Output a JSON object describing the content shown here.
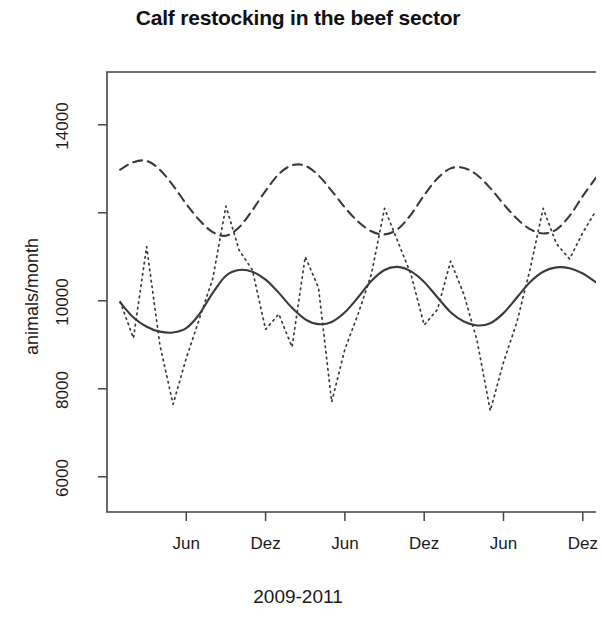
{
  "chart_data": {
    "type": "line",
    "title": "Calf restocking in the beef sector",
    "xlabel": "2009-2011",
    "ylabel": "animals/month",
    "grid": false,
    "legend": null,
    "xlim": [
      0,
      37
    ],
    "ylim": [
      5200,
      15200
    ],
    "y_ticks": [
      6000,
      8000,
      10000,
      12000,
      14000
    ],
    "y_tick_labels": [
      "6000",
      "8000",
      "10000",
      "12000",
      "14000"
    ],
    "y_tick_labels_shown": [
      "6000",
      "8000",
      "10000",
      "14000"
    ],
    "x_ticks": [
      6,
      12,
      18,
      24,
      30,
      36
    ],
    "x_tick_labels": [
      "Jun",
      "Dez",
      "Jun",
      "Dez",
      "Jun",
      "Dez"
    ],
    "x": [
      1,
      2,
      3,
      4,
      5,
      6,
      7,
      8,
      9,
      10,
      11,
      12,
      13,
      14,
      15,
      16,
      17,
      18,
      19,
      20,
      21,
      22,
      23,
      24,
      25,
      26,
      27,
      28,
      29,
      30,
      31,
      32,
      33,
      34,
      35,
      36,
      37
    ],
    "series": [
      {
        "name": "observed",
        "style": "dotted",
        "values": [
          9980,
          9150,
          11230,
          9000,
          7650,
          8700,
          9600,
          10500,
          12150,
          11150,
          10700,
          9350,
          9700,
          8950,
          11000,
          10300,
          7700,
          8900,
          9700,
          10600,
          12100,
          11350,
          10600,
          9450,
          9800,
          10900,
          10150,
          9100,
          7500,
          8600,
          9500,
          10700,
          12100,
          11300,
          10950,
          11550,
          12050
        ]
      },
      {
        "name": "trend",
        "style": "solid",
        "values": [
          9960,
          9620,
          9410,
          9300,
          9280,
          9380,
          9700,
          10180,
          10570,
          10700,
          10660,
          10480,
          10180,
          9840,
          9580,
          9470,
          9520,
          9740,
          10080,
          10450,
          10700,
          10770,
          10670,
          10430,
          10080,
          9740,
          9530,
          9440,
          9490,
          9720,
          10070,
          10420,
          10660,
          10760,
          10740,
          10620,
          10420
        ]
      },
      {
        "name": "upper-band",
        "style": "dashed",
        "values": [
          12980,
          13150,
          13180,
          12980,
          12620,
          12200,
          11830,
          11560,
          11480,
          11670,
          12060,
          12500,
          12880,
          13080,
          13070,
          12850,
          12500,
          12120,
          11800,
          11580,
          11510,
          11630,
          11960,
          12400,
          12780,
          13010,
          13020,
          12860,
          12560,
          12200,
          11870,
          11630,
          11530,
          11620,
          11930,
          12380,
          12800
        ]
      }
    ]
  },
  "axes": {
    "plot_box": {
      "left": 107,
      "top": 72,
      "right": 596,
      "bottom": 512
    }
  }
}
